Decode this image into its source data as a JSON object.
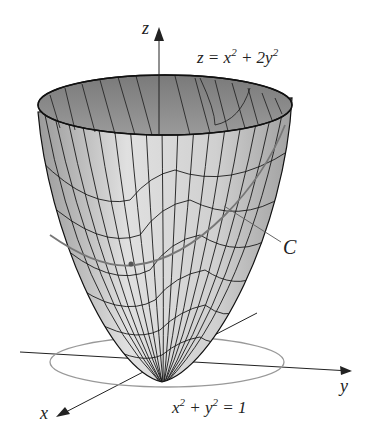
{
  "figure": {
    "surface_equation": "z = x² + 2y²",
    "surface_equation_parts": {
      "lhs": "z = x",
      "mid": " + 2y",
      "exp": "2"
    },
    "curve_label": "C",
    "circle_equation_parts": {
      "a": "x",
      "b": " + y",
      "rhs": " = 1",
      "exp": "2"
    },
    "axes": {
      "x": "x",
      "y": "y",
      "z": "z"
    },
    "colors": {
      "surface_light": "#d9d9d9",
      "surface_dark": "#8c8c8c",
      "mesh": "#1a1a1a",
      "circle": "#888888",
      "axis": "#222222"
    }
  }
}
